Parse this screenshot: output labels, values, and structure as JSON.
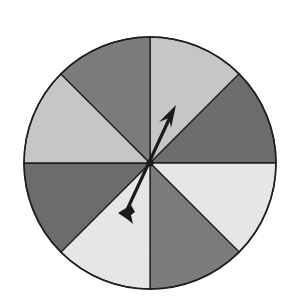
{
  "diagram": {
    "type": "spinner",
    "sector_count": 8,
    "sectors": [
      {
        "index": 0,
        "start_deg": 0,
        "end_deg": 45,
        "shade": "light",
        "color": "#c6c6c6"
      },
      {
        "index": 1,
        "start_deg": 45,
        "end_deg": 90,
        "shade": "dark",
        "color": "#6c6c6c"
      },
      {
        "index": 2,
        "start_deg": 90,
        "end_deg": 135,
        "shade": "very-light",
        "color": "#e6e6e6"
      },
      {
        "index": 3,
        "start_deg": 135,
        "end_deg": 180,
        "shade": "medium",
        "color": "#7c7c7c"
      },
      {
        "index": 4,
        "start_deg": 180,
        "end_deg": 225,
        "shade": "very-light",
        "color": "#e6e6e6"
      },
      {
        "index": 5,
        "start_deg": 225,
        "end_deg": 270,
        "shade": "dark",
        "color": "#6c6c6c"
      },
      {
        "index": 6,
        "start_deg": 270,
        "end_deg": 315,
        "shade": "light",
        "color": "#c6c6c6"
      },
      {
        "index": 7,
        "start_deg": 315,
        "end_deg": 360,
        "shade": "medium",
        "color": "#7c7c7c"
      }
    ],
    "arrow": {
      "pointing_deg": 27,
      "color": "#1a1a1a"
    },
    "outline_color": "#1e1e1e"
  }
}
